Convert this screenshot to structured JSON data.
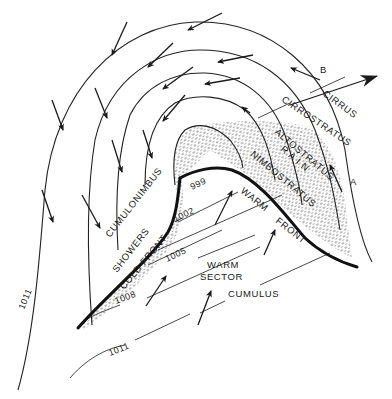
{
  "diagram": {
    "labels": {
      "cumulonimbus": "CUMULONIMBUS",
      "showers": "SHOWERS",
      "cold_front": "COLD FRONT",
      "warm_front_1": "WARM",
      "warm_front_2": "FRONT",
      "warm_sector_1": "WARM",
      "warm_sector_2": "SECTOR",
      "cumulus": "CUMULUS",
      "cirrus": "CIRRUS",
      "cirrostratus": "CIRROSTRATUS",
      "altostratus": "ALTOSTRATUS",
      "rain": "R A I N",
      "nimbostratus": "NIMBOSTRATUS",
      "point_a": "A",
      "point_b": "B"
    },
    "isobars": {
      "p999": "999",
      "p1002": "1002",
      "p1005": "1005",
      "p1008": "1008",
      "p1011_left": "1011",
      "p1011_bottom": "1011"
    },
    "colors": {
      "ink": "#1a1a1a",
      "background": "#ffffff",
      "stipple": "#555555"
    }
  }
}
